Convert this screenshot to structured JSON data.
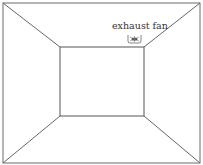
{
  "diagram": {
    "type": "room-perspective",
    "labels": {
      "exhaust_fan": "exhaust fan"
    },
    "components": [
      {
        "name": "back-wall",
        "shape": "rectangle"
      },
      {
        "name": "ceiling",
        "shape": "trapezoid"
      },
      {
        "name": "floor",
        "shape": "trapezoid"
      },
      {
        "name": "left-wall",
        "shape": "trapezoid"
      },
      {
        "name": "right-wall",
        "shape": "trapezoid"
      },
      {
        "name": "exhaust-fan",
        "location": "ceiling, near back-right corner"
      }
    ],
    "colors": {
      "line": "#555555",
      "background": "#ffffff",
      "text": "#333333"
    }
  }
}
